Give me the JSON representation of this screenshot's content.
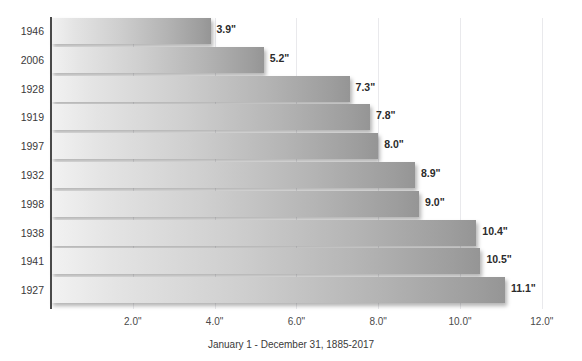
{
  "chart_data": {
    "type": "bar",
    "orientation": "horizontal",
    "title": "",
    "xlabel": "January 1 - December 31, 1885-2017",
    "ylabel": "",
    "categories": [
      "1946",
      "2006",
      "1928",
      "1919",
      "1997",
      "1932",
      "1998",
      "1938",
      "1941",
      "1927"
    ],
    "values": [
      3.9,
      5.2,
      7.3,
      7.8,
      8.0,
      8.9,
      9.0,
      10.4,
      10.5,
      11.1
    ],
    "value_labels": [
      "3.9\"",
      "5.2\"",
      "7.3\"",
      "7.8\"",
      "8.0\"",
      "8.9\"",
      "9.0\"",
      "10.4\"",
      "10.5\"",
      "11.1\""
    ],
    "xlim": [
      0,
      12.5
    ],
    "xticks": [
      2.0,
      4.0,
      6.0,
      8.0,
      10.0,
      12.0
    ],
    "xtick_labels": [
      "2.0\"",
      "4.0\"",
      "6.0\"",
      "8.0\"",
      "10.0\"",
      "12.0\""
    ],
    "grid": "vertical-only",
    "legend": "none",
    "bar_color_start": "#f2f2f2",
    "bar_color_end": "#959595",
    "axis_color": "#4a4a4a",
    "grid_color": "#e9e9ec"
  },
  "caption": "January 1 - December 31, 1885-2017",
  "title_remnant": "",
  "axis": {
    "y_axis_label": "",
    "x_axis_label": "January 1 - December 31, 1885-2017"
  }
}
